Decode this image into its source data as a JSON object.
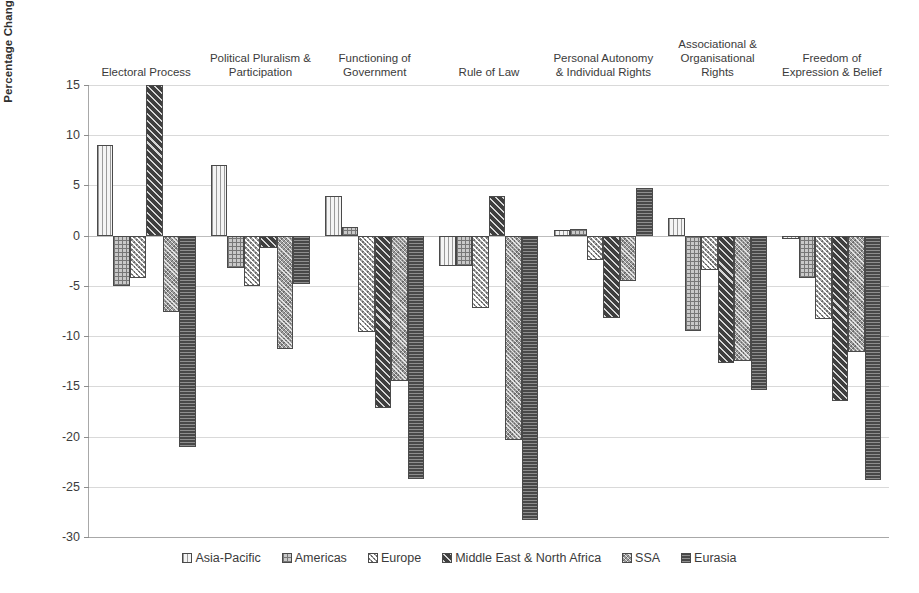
{
  "chart_data": {
    "type": "bar",
    "title": "",
    "xlabel": "",
    "ylabel": "Percentage Change in Score over the Last 13 Years",
    "ylim": [
      -30,
      15
    ],
    "yticks": [
      15,
      10,
      5,
      0,
      -5,
      -10,
      -15,
      -20,
      -25,
      -30
    ],
    "ytick_labels": [
      "15",
      "10",
      "5",
      "0",
      "-5",
      "-10",
      "-15",
      "-20",
      "-25",
      "-30"
    ],
    "grid": true,
    "legend_position": "bottom",
    "categories": [
      "Electoral Process",
      "Political Pluralism &\nParticipation",
      "Functioning of\nGovernment",
      "Rule of Law",
      "Personal Autonomy\n& Individual Rights",
      "Associational &\nOrganisational\nRights",
      "Freedom of\nExpression & Belief"
    ],
    "series": [
      {
        "name": "Asia-Pacific",
        "values": [
          9.0,
          7.0,
          3.9,
          -3.0,
          0.6,
          1.8,
          -0.3
        ]
      },
      {
        "name": "Americas",
        "values": [
          -5.0,
          -3.2,
          0.9,
          -3.0,
          0.7,
          -9.5,
          -4.2
        ]
      },
      {
        "name": "Europe",
        "values": [
          -4.2,
          -5.0,
          -9.6,
          -7.2,
          -2.4,
          -3.4,
          -8.3
        ]
      },
      {
        "name": "Middle East & North Africa",
        "values": [
          15.0,
          -1.2,
          -17.2,
          3.9,
          -8.2,
          -12.7,
          -16.5
        ]
      },
      {
        "name": "SSA",
        "values": [
          -7.6,
          -11.3,
          -14.5,
          -20.3,
          -4.5,
          -12.5,
          -11.6
        ]
      },
      {
        "name": "Eurasia",
        "values": [
          -21.0,
          -4.8,
          -24.2,
          -28.3,
          4.7,
          -15.4,
          -24.3
        ]
      }
    ]
  },
  "legend": {
    "items": [
      {
        "label": "Asia-Pacific"
      },
      {
        "label": "Americas"
      },
      {
        "label": "Europe"
      },
      {
        "label": "Middle East & North Africa"
      },
      {
        "label": "SSA"
      },
      {
        "label": "Eurasia"
      }
    ]
  }
}
